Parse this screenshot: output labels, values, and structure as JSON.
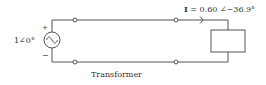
{
  "diagram": {
    "type": "circuit",
    "source": {
      "label": "1∠0°",
      "plus": "+",
      "minus": "−",
      "icon": "ac-voltage-source-icon"
    },
    "current_label": {
      "bold_symbol": "I",
      "value": " = 0.60 ∠−36.9°"
    },
    "transformer_label": "Transformer",
    "load": {
      "icon": "load-impedance-box"
    },
    "colors": {
      "wire": "#555555",
      "text": "#333333",
      "background": "#ffffff"
    }
  }
}
